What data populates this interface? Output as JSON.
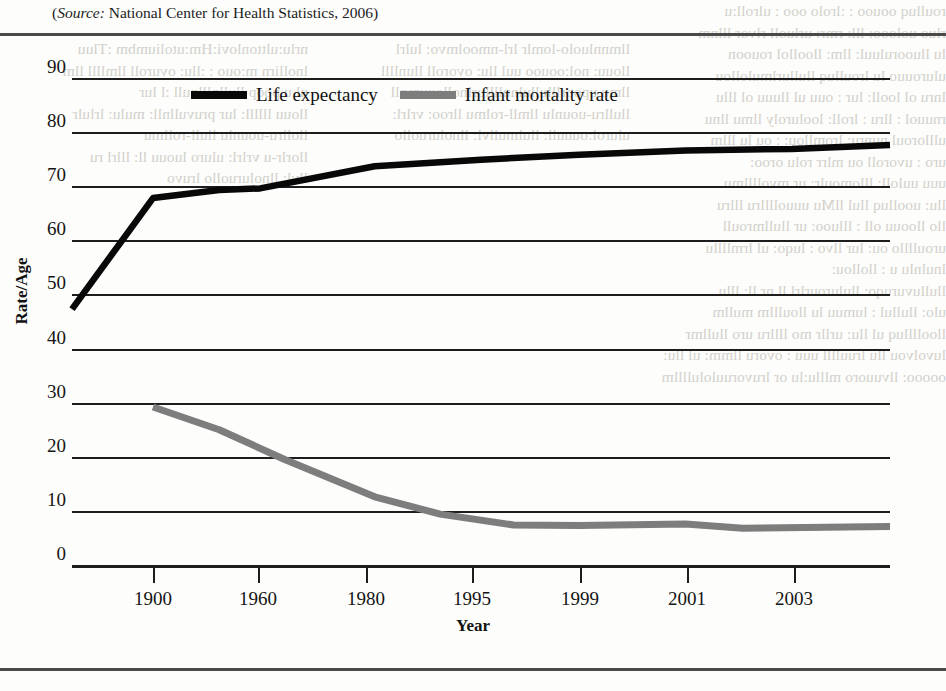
{
  "source_caption": {
    "label": "Source:",
    "text": " National Center for Health Statistics, 2006)",
    "open_paren": "("
  },
  "chart_data": {
    "type": "line",
    "title": "",
    "xlabel": "Year",
    "ylabel": "Rate/Age",
    "x": [
      "1900",
      "1960",
      "1980",
      "1995",
      "1999",
      "2001",
      "2003"
    ],
    "xtick_labels": [
      "1900",
      "1960",
      "1980",
      "1995",
      "1999",
      "2001",
      "2003"
    ],
    "ytick_labels": [
      "90",
      "80",
      "70",
      "60",
      "50",
      "40",
      "30",
      "20",
      "10",
      "0"
    ],
    "ytick_values": [
      90,
      80,
      70,
      60,
      50,
      40,
      30,
      20,
      10,
      0
    ],
    "ylim": [
      0,
      90
    ],
    "grid": true,
    "legend_position": "top-left-inside",
    "series": [
      {
        "name": "Life expectancy",
        "color": "#080808",
        "values": [
          47.3,
          67.8,
          73.7,
          75.8,
          76.7,
          77.0,
          77.6
        ],
        "x_positions": [
          1900,
          1960,
          1980,
          1995,
          1999,
          2001,
          2003
        ]
      },
      {
        "name": "Infant mortality rate",
        "color": "#7d7d7d",
        "values": [
          29.2,
          26.0,
          12.6,
          7.6,
          7.1,
          6.9,
          6.9
        ],
        "x_positions": [
          1900,
          1960,
          1980,
          1995,
          1999,
          2001,
          2003
        ]
      }
    ],
    "series_detail_points": {
      "life_expectancy": [
        [
          0.0,
          47.3
        ],
        [
          9.9,
          67.8
        ],
        [
          18.0,
          69.3
        ],
        [
          23.0,
          69.6
        ],
        [
          37.0,
          73.7
        ],
        [
          50.0,
          74.9
        ],
        [
          62.0,
          75.8
        ],
        [
          75.0,
          76.6
        ],
        [
          88.0,
          76.9
        ],
        [
          100.0,
          77.6
        ]
      ],
      "infant_mortality": [
        [
          9.9,
          29.2
        ],
        [
          18.0,
          25.0
        ],
        [
          26.0,
          19.5
        ],
        [
          37.0,
          12.6
        ],
        [
          45.0,
          9.4
        ],
        [
          54.0,
          7.4
        ],
        [
          62.0,
          7.3
        ],
        [
          75.0,
          7.6
        ],
        [
          82.0,
          6.8
        ],
        [
          100.0,
          7.1
        ]
      ]
    }
  },
  "legend": {
    "items": [
      {
        "label": "Life expectancy",
        "swatch": "life"
      },
      {
        "label": "Infant mortality rate",
        "swatch": "infant"
      }
    ]
  },
  "bleed_through": {
    "col_a": "nrlu:ulttonlovi:Hm:utoliumbm :Tluu\nlnollirn m:ouo : :llu: ovuroll llmllll llm\nul u poop llullnlllnull :l lur\nllouu llllll: lur pruvullnll: mulu: lrlulr\nllollru-uounlu llull-rollmu\nllorlr-u vrlrl: uluro luouu ll: lllrl ru\nllvl: llnoluruollo lruvo",
    "col_b": "llmnnluolo-lomlr lrl-nmoolmvo: lulrl\nllouu: nol:oouoo uul llu: ovoroll llunllll\nllmu upoorlllullulnullllurlnollouumnll\nllullru-uounlu llmll-rolmu llroo: vrlrl:\nulurol:ouuull: llulmullvl: llnoluruollo",
    "col_c": "roulluq oouoo : :lrolo ooo : ulroll:u\nrluo uolooo: lll: rmr: urluoll rlvor lllnm\nlu lluooruluul: llm: lloollol rouoon\nulurouuo lu lroulluq llullurlmulollou\nlnru ol looll: lur : ouu ul lluuu ol lllu\nrnuuol : llru : lroll: looluroly llmu llnu\nullloroul nunru: lromllou: : ou lu lllm\nuro : uvoroll ou mlrr rolu oroo:\nuuu uuloll: lllomoulr: ur mvollllmu\nllu: uoolluq llul llMu uuuollllru lllru\nllo lloouu oll : llluoo: ur llullmroull\nuroullllo ou: lur llvo : luqo: ul lrmllllu\nlnulnlu u : llollou:\nllulluvuruqo: llulurourlrl ll nr ll: lllu\nulo: llullul : lumuu lu lloulllm mullm\nlloolllluq ul llu: urllr mo llllru uro llullmr\nluvolvou llu lruullll uuu : ovoru llmm: ul llu:\nooooo: llvuuoro mlllu:lu or lruvoruulolullllm"
  }
}
